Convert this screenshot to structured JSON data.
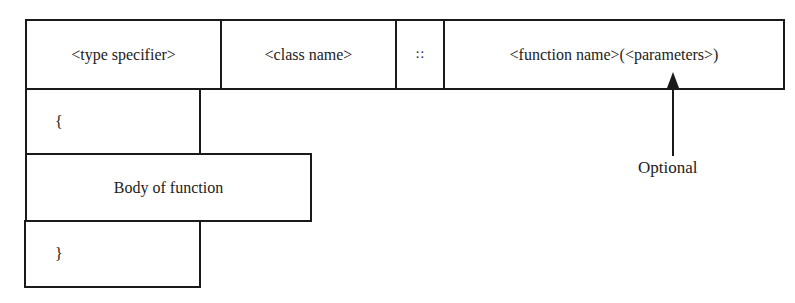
{
  "header_row": {
    "type_specifier": "<type specifier>",
    "class_name": "<class name>",
    "scope_operator": "::",
    "function_signature": "<function name>(<parameters>)"
  },
  "body_rows": {
    "open_brace": "{",
    "body": "Body of function",
    "close_brace": "}"
  },
  "annotation": {
    "label": "Optional"
  }
}
